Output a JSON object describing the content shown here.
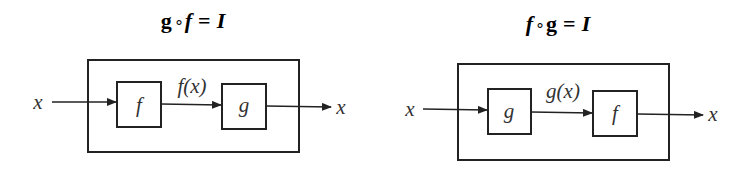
{
  "diagrams": [
    {
      "title": "g∘f = I",
      "title_parts": {
        "a": "g",
        "op": "∘",
        "b": "f",
        "eq": "=",
        "rhs": "I"
      },
      "input": "x",
      "first_block": "f",
      "intermediate": "f(x)",
      "second_block": "g",
      "output": "x"
    },
    {
      "title": "f∘g = I",
      "title_parts": {
        "a": "f",
        "op": "∘",
        "b": "g",
        "eq": "=",
        "rhs": "I"
      },
      "input": "x",
      "first_block": "g",
      "intermediate": "g(x)",
      "second_block": "f",
      "output": "x"
    }
  ]
}
